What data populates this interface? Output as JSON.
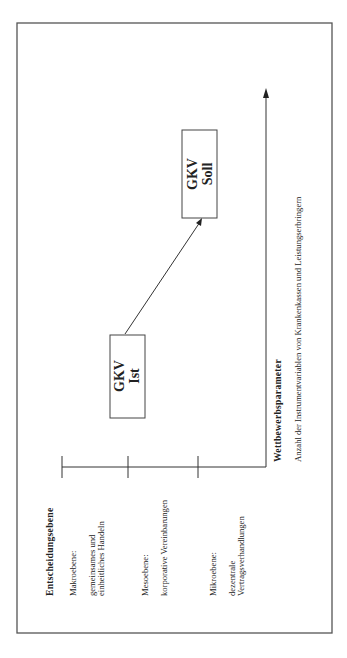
{
  "diagram": {
    "y_axis": {
      "title": "Entscheidungsebene",
      "levels": [
        {
          "name": "Makroebene:",
          "desc_lines": [
            "gemeinsames und",
            "einheitliches Handeln"
          ]
        },
        {
          "name": "Mesoebene:",
          "desc_lines": [
            "korporative Vereinbarungen"
          ]
        },
        {
          "name": "Mikroebene:",
          "desc_lines": [
            "dezentrale",
            "Vertragsverhandlungen"
          ]
        }
      ]
    },
    "x_axis": {
      "title": "Wettbewerbsparameter",
      "subtitle": "Anzahl der Instrumentvariablen von Krankenkassen und Leistungserbringern"
    },
    "nodes": [
      {
        "id": "ist",
        "lines": [
          "GKV",
          "Ist"
        ]
      },
      {
        "id": "soll",
        "lines": [
          "GKV",
          "Soll"
        ]
      }
    ],
    "edges": [
      {
        "from": "ist",
        "to": "soll"
      }
    ],
    "orientation": "rotated 90° counter-clockwise"
  }
}
